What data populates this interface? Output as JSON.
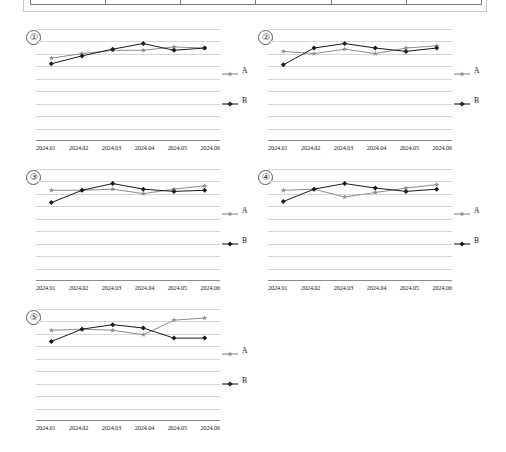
{
  "top_table": {
    "name": "cut-off-data-table",
    "columns": 6,
    "cells": [
      "",
      "",
      "",
      "",
      "",
      ""
    ]
  },
  "legend": {
    "series_a_label": "A",
    "series_b_label": "B",
    "a_marker": "star-marker-icon",
    "b_marker": "diamond-marker-icon",
    "a_color": "#8c8c8c",
    "b_color": "#1a1a1a",
    "position": "right"
  },
  "axis": {
    "categories": [
      "2024.01",
      "2024.02",
      "2024.03",
      "2024.04",
      "2024.05",
      "2024.06"
    ],
    "ylim": [
      0,
      100
    ],
    "grid": true,
    "gridlines": 9,
    "ticks_visible": false
  },
  "panels": [
    {
      "number": "①"
    },
    {
      "number": "②"
    },
    {
      "number": "③"
    },
    {
      "number": "④"
    },
    {
      "number": "⑤"
    }
  ],
  "chart_data": [
    {
      "id": "chart-1",
      "number": "①",
      "type": "line",
      "title": "",
      "xlabel": "",
      "ylabel": "",
      "categories": [
        "2024.01",
        "2024.02",
        "2024.03",
        "2024.04",
        "2024.05",
        "2024.06"
      ],
      "ylim": [
        0,
        100
      ],
      "grid": true,
      "legend": "right",
      "series": [
        {
          "name": "A",
          "color": "#8c8c8c",
          "marker": "star",
          "values": [
            74,
            78,
            81,
            81,
            84,
            83
          ]
        },
        {
          "name": "B",
          "color": "#1a1a1a",
          "marker": "diamond",
          "values": [
            69,
            76,
            82,
            87,
            81,
            83
          ]
        }
      ]
    },
    {
      "id": "chart-2",
      "number": "②",
      "type": "line",
      "title": "",
      "xlabel": "",
      "ylabel": "",
      "categories": [
        "2024.01",
        "2024.02",
        "2024.03",
        "2024.04",
        "2024.05",
        "2024.06"
      ],
      "ylim": [
        0,
        100
      ],
      "grid": true,
      "legend": "right",
      "series": [
        {
          "name": "A",
          "color": "#8c8c8c",
          "marker": "star",
          "values": [
            80,
            78,
            82,
            78,
            83,
            85
          ]
        },
        {
          "name": "B",
          "color": "#1a1a1a",
          "marker": "diamond",
          "values": [
            68,
            83,
            87,
            83,
            80,
            83
          ]
        }
      ]
    },
    {
      "id": "chart-3",
      "number": "③",
      "type": "line",
      "title": "",
      "xlabel": "",
      "ylabel": "",
      "categories": [
        "2024.01",
        "2024.02",
        "2024.03",
        "2024.04",
        "2024.05",
        "2024.06"
      ],
      "ylim": [
        0,
        100
      ],
      "grid": true,
      "legend": "right",
      "series": [
        {
          "name": "A",
          "color": "#8c8c8c",
          "marker": "star",
          "values": [
            81,
            81,
            82,
            78,
            82,
            85
          ]
        },
        {
          "name": "B",
          "color": "#1a1a1a",
          "marker": "diamond",
          "values": [
            70,
            81,
            87,
            82,
            80,
            81
          ]
        }
      ]
    },
    {
      "id": "chart-4",
      "number": "④",
      "type": "line",
      "title": "",
      "xlabel": "",
      "ylabel": "",
      "categories": [
        "2024.01",
        "2024.02",
        "2024.03",
        "2024.04",
        "2024.05",
        "2024.06"
      ],
      "ylim": [
        0,
        100
      ],
      "grid": true,
      "legend": "right",
      "series": [
        {
          "name": "A",
          "color": "#8c8c8c",
          "marker": "star",
          "values": [
            81,
            82,
            75,
            79,
            83,
            86
          ]
        },
        {
          "name": "B",
          "color": "#1a1a1a",
          "marker": "diamond",
          "values": [
            71,
            82,
            87,
            83,
            80,
            82
          ]
        }
      ]
    },
    {
      "id": "chart-5",
      "number": "⑤",
      "type": "line",
      "title": "",
      "xlabel": "",
      "ylabel": "",
      "categories": [
        "2024.01",
        "2024.02",
        "2024.03",
        "2024.04",
        "2024.05",
        "2024.06"
      ],
      "ylim": [
        0,
        100
      ],
      "grid": true,
      "legend": "right",
      "series": [
        {
          "name": "A",
          "color": "#8c8c8c",
          "marker": "star",
          "values": [
            81,
            82,
            81,
            77,
            90,
            92
          ]
        },
        {
          "name": "B",
          "color": "#1a1a1a",
          "marker": "diamond",
          "values": [
            71,
            82,
            86,
            83,
            74,
            74
          ]
        }
      ]
    }
  ]
}
